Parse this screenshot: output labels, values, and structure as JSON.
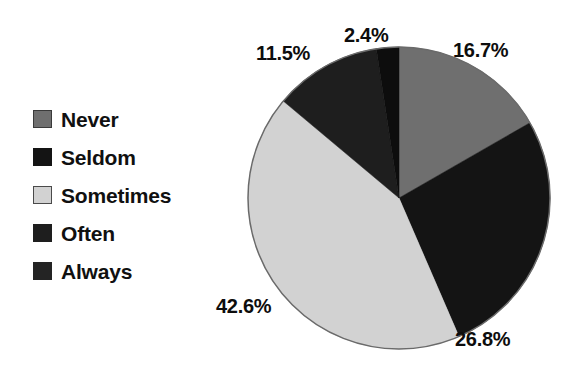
{
  "chart_data": {
    "type": "pie",
    "title": "",
    "subtitle": "",
    "xlabel": "",
    "ylabel": "",
    "grid": false,
    "legend_position": "left",
    "start_angle_deg": 0,
    "direction": "clockwise",
    "categories": [
      "Never",
      "Seldom",
      "Sometimes",
      "Often",
      "Always"
    ],
    "values": [
      16.7,
      26.8,
      42.6,
      11.5,
      2.4
    ],
    "value_unit": "%",
    "data_labels": [
      "16.7%",
      "26.8%",
      "42.6%",
      "11.5%",
      "2.4%"
    ],
    "colors": [
      "#6f6f6f",
      "#141414",
      "#d2d2d2",
      "#1e1e1e",
      "#0d0d0d"
    ],
    "slices": [
      {
        "label": "Never",
        "value": 16.7,
        "data_label": "16.7%",
        "color": "#6f6f6f"
      },
      {
        "label": "Seldom",
        "value": 26.8,
        "data_label": "26.8%",
        "color": "#141414"
      },
      {
        "label": "Sometimes",
        "value": 42.6,
        "data_label": "42.6%",
        "color": "#d2d2d2"
      },
      {
        "label": "Often",
        "value": 11.5,
        "data_label": "11.5%",
        "color": "#1e1e1e"
      },
      {
        "label": "Always",
        "value": 2.4,
        "data_label": "2.4%",
        "color": "#0d0d0d"
      }
    ]
  },
  "legend": {
    "items": [
      {
        "label": "Never",
        "color": "#6f6f6f",
        "border": "#3a3a3a"
      },
      {
        "label": "Seldom",
        "color": "#141414",
        "border": "#141414"
      },
      {
        "label": "Sometimes",
        "color": "#d2d2d2",
        "border": "#4a4a4a"
      },
      {
        "label": "Often",
        "color": "#1e1e1e",
        "border": "#1e1e1e"
      },
      {
        "label": "Always",
        "color": "#242424",
        "border": "#242424"
      }
    ]
  },
  "labels": {
    "never": "16.7%",
    "seldom": "26.8%",
    "sometimes": "42.6%",
    "often": "11.5%",
    "always": "2.4%"
  },
  "colors": {
    "background": "#ffffff",
    "text": "#101010",
    "pie_outline": "#6a6a6a"
  }
}
